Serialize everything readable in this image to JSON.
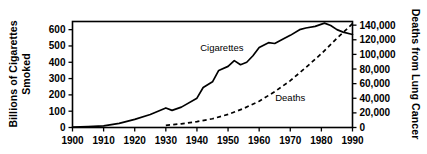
{
  "chart_data": {
    "type": "line",
    "title": "",
    "xlabel": "",
    "ylabel": "Billions of Cigarettes Smoked",
    "y2label": "Deaths from Lung Cancer",
    "grid": false,
    "legend": "inline-annotations",
    "xlim": [
      1900,
      1990
    ],
    "ylim": [
      0,
      650
    ],
    "y2lim": [
      0,
      145000
    ],
    "xticks": [
      "1900",
      "1910",
      "1920",
      "1930",
      "1940",
      "1950",
      "1960",
      "1970",
      "1980",
      "1990"
    ],
    "yticks": [
      "0",
      "100",
      "200",
      "300",
      "400",
      "500",
      "600"
    ],
    "y2ticks": [
      "0",
      "20,000",
      "40,000",
      "60,000",
      "80,000",
      "100,000",
      "120,000",
      "140,000"
    ],
    "series": [
      {
        "name": "Cigarettes",
        "style": "solid",
        "axis": "left",
        "units": "billions of cigarettes smoked",
        "x": [
          1900,
          1905,
          1910,
          1915,
          1920,
          1925,
          1930,
          1932,
          1935,
          1940,
          1942,
          1945,
          1947,
          1950,
          1952,
          1954,
          1956,
          1958,
          1960,
          1963,
          1965,
          1968,
          1970,
          1973,
          1975,
          1978,
          1981,
          1983,
          1985,
          1987,
          1990
        ],
        "values": [
          2,
          5,
          10,
          25,
          50,
          80,
          120,
          105,
          125,
          180,
          245,
          280,
          350,
          375,
          410,
          385,
          400,
          440,
          490,
          520,
          515,
          545,
          565,
          600,
          610,
          620,
          640,
          625,
          600,
          585,
          570
        ]
      },
      {
        "name": "Deaths",
        "style": "dashed",
        "axis": "right",
        "units": "deaths from lung cancer",
        "x": [
          1930,
          1935,
          1940,
          1945,
          1950,
          1955,
          1960,
          1965,
          1970,
          1975,
          1980,
          1985,
          1990
        ],
        "values": [
          3000,
          5000,
          8000,
          12000,
          18000,
          26000,
          36000,
          49000,
          64000,
          82000,
          101000,
          122000,
          142000
        ]
      }
    ],
    "annotations": [
      {
        "text": "Cigarettes",
        "x": 1948,
        "y": 470
      },
      {
        "text": "Deaths",
        "x": 1970,
        "y": 165
      }
    ]
  }
}
